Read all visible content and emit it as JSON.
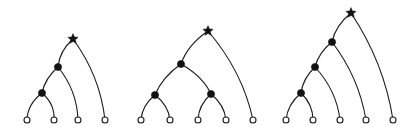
{
  "figure": {
    "background_color": "#ffffff",
    "stroke_color": "#1a1a1a",
    "node_fill_color": "#121212",
    "leaf_fill_color": "#ffffff",
    "width": 417,
    "height": 137
  },
  "chart_data": {
    "type": "diagram",
    "subtype": "rooted-tree-trio",
    "title": "",
    "xlabel": "",
    "ylabel": "",
    "panel_count": 3,
    "marker_legend": [
      {
        "name": "root-star",
        "glyph": "star",
        "filled": true,
        "meaning": "root"
      },
      {
        "name": "internal-node",
        "glyph": "circle",
        "filled": true,
        "meaning": "internal node"
      },
      {
        "name": "leaf-node",
        "glyph": "circle",
        "filled": false,
        "meaning": "leaf"
      }
    ],
    "panels": [
      {
        "id": "panel-1",
        "label": "",
        "leaf_count": 4,
        "internal_count": 2,
        "shape": "caterpillar",
        "root": {
          "name": "root",
          "x": 73,
          "y": 39,
          "marker": "star"
        },
        "internal_nodes": [
          {
            "name": "n1",
            "x": 58,
            "y": 67,
            "marker": "filled-circle"
          },
          {
            "name": "n2",
            "x": 42,
            "y": 93,
            "marker": "filled-circle"
          }
        ],
        "leaves": [
          {
            "name": "l1",
            "x": 27,
            "y": 120,
            "marker": "open-circle"
          },
          {
            "name": "l2",
            "x": 54,
            "y": 120,
            "marker": "open-circle"
          },
          {
            "name": "l3",
            "x": 78,
            "y": 120,
            "marker": "open-circle"
          },
          {
            "name": "l4",
            "x": 105,
            "y": 120,
            "marker": "open-circle"
          }
        ],
        "edges": [
          {
            "from": "n2",
            "to": "l1",
            "bend": -7
          },
          {
            "from": "n2",
            "to": "l2",
            "bend": 7
          },
          {
            "from": "n1",
            "to": "n2",
            "bend": -5
          },
          {
            "from": "n1",
            "to": "l3",
            "bend": 9
          },
          {
            "from": "root",
            "to": "n1",
            "bend": -6
          },
          {
            "from": "root",
            "to": "l4",
            "bend": 11
          }
        ]
      },
      {
        "id": "panel-2",
        "label": "",
        "leaf_count": 5,
        "internal_count": 3,
        "shape": "balanced",
        "root": {
          "name": "root",
          "x": 208,
          "y": 31,
          "marker": "star"
        },
        "internal_nodes": [
          {
            "name": "n1",
            "x": 181,
            "y": 64,
            "marker": "filled-circle"
          },
          {
            "name": "n2",
            "x": 155,
            "y": 95,
            "marker": "filled-circle"
          },
          {
            "name": "n3",
            "x": 211,
            "y": 94,
            "marker": "filled-circle"
          }
        ],
        "leaves": [
          {
            "name": "l1",
            "x": 141,
            "y": 120,
            "marker": "open-circle"
          },
          {
            "name": "l2",
            "x": 170,
            "y": 120,
            "marker": "open-circle"
          },
          {
            "name": "l3",
            "x": 198,
            "y": 120,
            "marker": "open-circle"
          },
          {
            "name": "l4",
            "x": 226,
            "y": 120,
            "marker": "open-circle"
          },
          {
            "name": "l5",
            "x": 253,
            "y": 120,
            "marker": "open-circle"
          }
        ],
        "edges": [
          {
            "from": "n2",
            "to": "l1",
            "bend": -6
          },
          {
            "from": "n2",
            "to": "l2",
            "bend": 6
          },
          {
            "from": "n3",
            "to": "l3",
            "bend": -6
          },
          {
            "from": "n3",
            "to": "l4",
            "bend": 6
          },
          {
            "from": "n1",
            "to": "n2",
            "bend": -6
          },
          {
            "from": "n1",
            "to": "n3",
            "bend": 7
          },
          {
            "from": "root",
            "to": "n1",
            "bend": -7
          },
          {
            "from": "root",
            "to": "l5",
            "bend": 12
          }
        ]
      },
      {
        "id": "panel-3",
        "label": "",
        "leaf_count": 5,
        "internal_count": 3,
        "shape": "caterpillar",
        "root": {
          "name": "root",
          "x": 351,
          "y": 13,
          "marker": "star"
        },
        "internal_nodes": [
          {
            "name": "n1",
            "x": 332,
            "y": 42,
            "marker": "filled-circle"
          },
          {
            "name": "n2",
            "x": 315,
            "y": 67,
            "marker": "filled-circle"
          },
          {
            "name": "n3",
            "x": 301,
            "y": 93,
            "marker": "filled-circle"
          }
        ],
        "leaves": [
          {
            "name": "l1",
            "x": 286,
            "y": 120,
            "marker": "open-circle"
          },
          {
            "name": "l2",
            "x": 313,
            "y": 120,
            "marker": "open-circle"
          },
          {
            "name": "l3",
            "x": 340,
            "y": 120,
            "marker": "open-circle"
          },
          {
            "name": "l4",
            "x": 366,
            "y": 120,
            "marker": "open-circle"
          },
          {
            "name": "l5",
            "x": 393,
            "y": 120,
            "marker": "open-circle"
          }
        ],
        "edges": [
          {
            "from": "n3",
            "to": "l1",
            "bend": -6
          },
          {
            "from": "n3",
            "to": "l2",
            "bend": 6
          },
          {
            "from": "n2",
            "to": "n3",
            "bend": -5
          },
          {
            "from": "n2",
            "to": "l3",
            "bend": 9
          },
          {
            "from": "n1",
            "to": "n2",
            "bend": -5
          },
          {
            "from": "n1",
            "to": "l4",
            "bend": 10
          },
          {
            "from": "root",
            "to": "n1",
            "bend": -6
          },
          {
            "from": "root",
            "to": "l5",
            "bend": 12
          }
        ]
      }
    ]
  }
}
